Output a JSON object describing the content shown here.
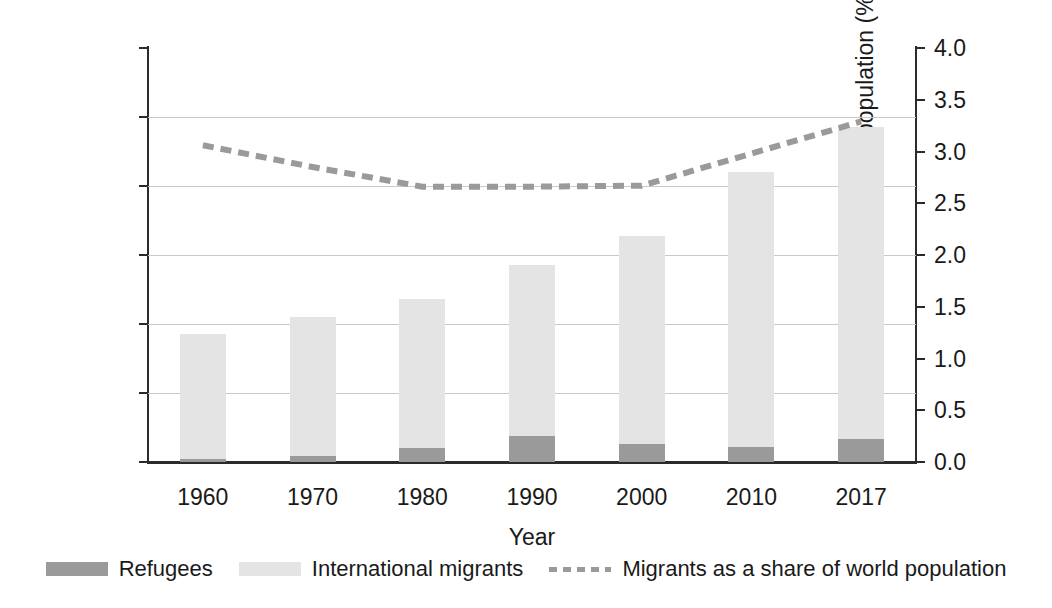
{
  "chart_data": {
    "type": "bar",
    "title": "",
    "subtitle": "",
    "xlabel": "Year",
    "categories": [
      "1960",
      "1970",
      "1980",
      "1990",
      "2000",
      "2010",
      "2017"
    ],
    "grid": true,
    "legend_position": "bottom",
    "axes": {
      "left": {
        "label": "International migrants (millions)",
        "ticks": [
          "0",
          "50",
          "100",
          "150",
          "200",
          "250",
          "300"
        ],
        "tick_values": [
          0,
          50,
          100,
          150,
          200,
          250,
          300
        ],
        "ylim": [
          0,
          300
        ]
      },
      "right": {
        "label": "Migrants as a share of world population (%)",
        "ticks": [
          "0.0",
          "0.5",
          "1.0",
          "1.5",
          "2.0",
          "2.5",
          "3.0",
          "3.5",
          "4.0"
        ],
        "tick_values": [
          0.0,
          0.5,
          1.0,
          1.5,
          2.0,
          2.5,
          3.0,
          3.5,
          4.0
        ],
        "ylim": [
          0,
          4
        ]
      }
    },
    "series": [
      {
        "name": "Refugees",
        "kind": "bar",
        "stack": "total",
        "axis": "left",
        "color": "#9a9a9a",
        "values": [
          2,
          4,
          10,
          19,
          13,
          11,
          17
        ]
      },
      {
        "name": "International migrants",
        "kind": "bar",
        "stack": "total",
        "axis": "left",
        "color": "#e4e4e4",
        "values": [
          93,
          105,
          118,
          143,
          164,
          210,
          243
        ]
      },
      {
        "name": "Migrants as a share of world population",
        "kind": "line",
        "style": "dashed",
        "axis": "right",
        "color": "#9a9a9a",
        "values": [
          3.06,
          2.85,
          2.66,
          2.66,
          2.67,
          2.98,
          3.29
        ]
      }
    ],
    "legend": [
      {
        "label": "Refugees",
        "marker": "square",
        "color": "#9a9a9a"
      },
      {
        "label": "International migrants",
        "marker": "square",
        "color": "#e4e4e4"
      },
      {
        "label": "Migrants as a share of world population",
        "marker": "dashed-line",
        "color": "#9a9a9a"
      }
    ]
  }
}
